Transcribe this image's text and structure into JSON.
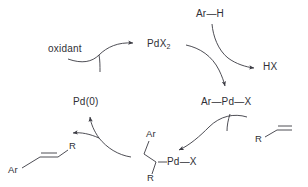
{
  "diagram": {
    "background_color": "#ffffff",
    "stroke_color": "#3a3a42",
    "text_color": "#2f2f36"
  },
  "species": {
    "catalyst_oxidized": "PdX",
    "catalyst_oxidized_sub": "2",
    "catalyst_reduced": "Pd(0)",
    "oxidant": "oxidant",
    "arene": "Ar—H",
    "byproduct": "HX",
    "aryl_palladium": "Ar—Pd—X",
    "alkene_label": "R",
    "intermediate": {
      "ar_label": "Ar",
      "r_label": "R",
      "pd_x_label": "Pd—X"
    },
    "product": {
      "ar_label": "Ar",
      "r_label": "R"
    }
  },
  "steps": [
    {
      "name": "reoxidation",
      "from": "Pd(0)",
      "to": "PdX2",
      "reagent": "oxidant"
    },
    {
      "name": "C—H activation",
      "from": "PdX2",
      "to": "Ar—Pd—X",
      "reagent": "Ar—H",
      "byproduct": "HX"
    },
    {
      "name": "migratory insertion",
      "from": "Ar—Pd—X",
      "to": "alkyl-Pd intermediate",
      "reagent": "alkene R"
    },
    {
      "name": "beta-hydride elimination",
      "from": "alkyl-Pd intermediate",
      "to": "Pd(0)",
      "product": "Ar—CH=CH—R"
    }
  ]
}
